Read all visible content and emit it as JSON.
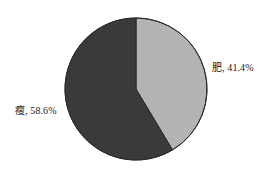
{
  "chart_data": {
    "type": "pie",
    "title": "",
    "subtitle": "",
    "xlabel": "",
    "ylabel": "",
    "grid": false,
    "legend_position": "none",
    "label_format": "{name}, {percent}",
    "background_color": "#ffffff",
    "outline_color": "#2b2b2b",
    "start_angle_deg": 0,
    "direction": "clockwise",
    "center": {
      "x": 136,
      "y": 89
    },
    "radius": 71,
    "categories": [
      "肥",
      "瘦"
    ],
    "values": [
      41.4,
      58.6
    ],
    "slices": [
      {
        "name": "肥",
        "percent": 41.4,
        "percent_text": "41.4%",
        "label": "肥, 41.4%",
        "color": "#b4b4b4",
        "start_angle_deg": 0,
        "sweep_angle_deg": 149.04,
        "label_position": "right"
      },
      {
        "name": "瘦",
        "percent": 58.6,
        "percent_text": "58.6%",
        "label": "瘦, 58.6%",
        "color": "#3a3a3a",
        "start_angle_deg": 149.04,
        "sweep_angle_deg": 210.96,
        "label_position": "left"
      }
    ]
  },
  "figure": {
    "labels": {
      "fat": "肥, 41.4%",
      "thin": "瘦, 58.6%"
    }
  }
}
